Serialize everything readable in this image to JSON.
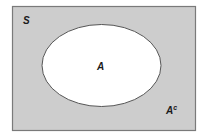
{
  "diagram": {
    "type": "venn",
    "universal_set": {
      "label": "S",
      "fill": "#cdcdcd",
      "stroke": "#7a7a7a"
    },
    "set_a": {
      "label": "A",
      "fill": "#ffffff",
      "stroke": "#555555"
    },
    "complement": {
      "label": "A",
      "superscript": "c"
    }
  }
}
